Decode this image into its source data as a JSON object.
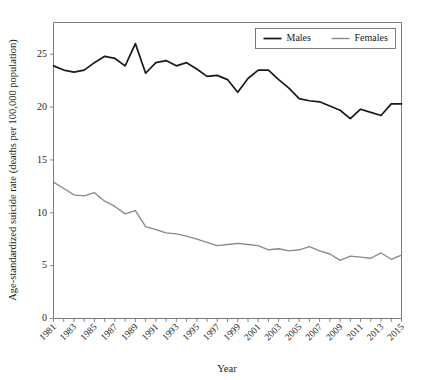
{
  "chart_data": {
    "type": "line",
    "title": "",
    "xlabel": "Year",
    "ylabel": "Age-standardized suicide rate (deaths per 100,000 population)",
    "x": [
      1981,
      1982,
      1983,
      1984,
      1985,
      1986,
      1987,
      1988,
      1989,
      1990,
      1991,
      1992,
      1993,
      1994,
      1995,
      1996,
      1997,
      1998,
      1999,
      2000,
      2001,
      2002,
      2003,
      2004,
      2005,
      2006,
      2007,
      2008,
      2009,
      2010,
      2011,
      2012,
      2013,
      2014,
      2015
    ],
    "xtick_labels": [
      "1981",
      "1983",
      "1985",
      "1987",
      "1989",
      "1991",
      "1993",
      "1995",
      "1997",
      "1999",
      "2001",
      "2003",
      "2005",
      "2007",
      "2009",
      "2011",
      "2013",
      "2015"
    ],
    "ytick_labels": [
      "0",
      "5",
      "10",
      "15",
      "20",
      "25"
    ],
    "ytick_values": [
      0,
      5,
      10,
      15,
      20,
      25
    ],
    "xlim": [
      1981,
      2015
    ],
    "ylim": [
      0,
      28
    ],
    "grid": false,
    "legend_position": "top-right",
    "series": [
      {
        "name": "Males",
        "color": "#1a1a1a",
        "values": [
          23.9,
          23.5,
          23.3,
          23.5,
          24.2,
          24.8,
          24.6,
          23.9,
          26.0,
          23.2,
          24.2,
          24.4,
          23.9,
          24.2,
          23.6,
          22.9,
          23.0,
          22.6,
          21.4,
          22.7,
          23.5,
          23.5,
          22.6,
          21.8,
          20.8,
          20.6,
          20.5,
          20.1,
          19.7,
          18.9,
          19.8,
          19.5,
          19.2,
          20.3,
          20.3
        ]
      },
      {
        "name": "Females",
        "color": "#8a8a8a",
        "values": [
          12.9,
          12.3,
          11.7,
          11.6,
          11.9,
          11.1,
          10.6,
          9.9,
          10.2,
          8.7,
          8.4,
          8.1,
          8.0,
          7.8,
          7.5,
          7.2,
          6.9,
          7.0,
          7.1,
          7.0,
          6.9,
          6.5,
          6.6,
          6.4,
          6.5,
          6.8,
          6.4,
          6.1,
          5.5,
          5.9,
          5.8,
          5.7,
          6.2,
          5.6,
          6.0
        ]
      }
    ],
    "series_tail_males": [
      21.5,
      20.6,
      20.1
    ],
    "series_tail_females": [
      6.1,
      6.3,
      6.3
    ]
  },
  "legend": {
    "entries": [
      {
        "label": "Males",
        "color": "#1a1a1a"
      },
      {
        "label": "Females",
        "color": "#8a8a8a"
      }
    ]
  }
}
